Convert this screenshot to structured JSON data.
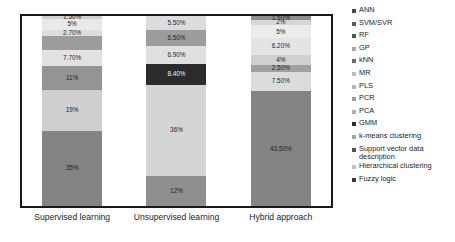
{
  "chart_data": {
    "type": "bar",
    "stacked": true,
    "orientation": "vertical",
    "title": "",
    "xlabel": "",
    "ylabel": "",
    "ylim": [
      0,
      100
    ],
    "grid": false,
    "legend_position": "right",
    "categories": [
      "Supervised learning",
      "Unsupervised learning",
      "Hybrid approach"
    ],
    "series": [
      {
        "name": "ANN",
        "color": "#808080",
        "values": [
          35,
          0,
          43.5
        ],
        "labels": [
          "35%",
          "",
          "43.50%"
        ]
      },
      {
        "name": "SVM/SVR",
        "color": "#c8c8c8",
        "values": [
          19,
          0,
          7.5
        ],
        "labels": [
          "19%",
          "",
          "7.50%"
        ]
      },
      {
        "name": "RF",
        "color": "#8a8a8a",
        "values": [
          11,
          0,
          2.5
        ],
        "labels": [
          "11%",
          "",
          "2.50%"
        ]
      },
      {
        "name": "GP",
        "color": "#dcdcdc",
        "values": [
          7.7,
          0,
          4
        ],
        "labels": [
          "7.70%",
          "",
          "4%"
        ]
      },
      {
        "name": "kNN",
        "color": "#9e9e9e",
        "values": [
          2.7,
          0,
          6.2
        ],
        "labels": [
          "2.70%",
          "",
          "6.20%"
        ]
      },
      {
        "name": "MR",
        "color": "#e6e6e6",
        "values": [
          5,
          0,
          5
        ],
        "labels": [
          "5%",
          "",
          "5%"
        ]
      },
      {
        "name": "PLS",
        "color": "#d2d2d2",
        "values": [
          1.5,
          0,
          2
        ],
        "labels": [
          "1.50%",
          "",
          "2%"
        ]
      },
      {
        "name": "PCR",
        "color": "#bdbdbd",
        "values": [
          0,
          0,
          1.5
        ],
        "labels": [
          "",
          "",
          "1.50%"
        ]
      },
      {
        "name": "PCA",
        "color": "#cfcfcf",
        "values": [
          0,
          0,
          0
        ],
        "labels": [
          "",
          "",
          ""
        ]
      },
      {
        "name": "GMM",
        "color": "#2b2b2b",
        "values": [
          0,
          8.4,
          0
        ],
        "labels": [
          "",
          "8.40%",
          ""
        ]
      },
      {
        "name": "k-means clustering",
        "color": "#d8d8d8",
        "values": [
          0,
          36,
          0
        ],
        "labels": [
          "",
          "36%",
          ""
        ]
      },
      {
        "name": "Support vector data description",
        "color": "#8f8f8f",
        "values": [
          0,
          12,
          0
        ],
        "labels": [
          "",
          "12%",
          ""
        ]
      },
      {
        "name": "Hierarchical clustering",
        "color": "#dadada",
        "values": [
          0,
          6.9,
          0
        ],
        "labels": [
          "",
          "6.90%",
          ""
        ]
      },
      {
        "name": "Fuzzy logic",
        "color": "#9a9a9a",
        "values": [
          0,
          6.5,
          0
        ],
        "labels": [
          "",
          "6.50%",
          ""
        ]
      }
    ],
    "bars": [
      {
        "category": "Supervised learning",
        "segments": [
          {
            "series": "PLS",
            "value": 1.5,
            "label": "1.50%",
            "color": "#d2d2d2",
            "dark": false
          },
          {
            "series": "MR",
            "value": 5,
            "label": "5%",
            "color": "#e9e9e9",
            "dark": false
          },
          {
            "series": "kNN",
            "value": 2.7,
            "label": "2.70%",
            "color": "#dddddd",
            "dark": false
          },
          {
            "series": "GP-dark",
            "value": 6.6,
            "label": "",
            "color": "#9c9c9c",
            "dark": false
          },
          {
            "series": "GP",
            "value": 7.7,
            "label": "7.70%",
            "color": "#e2e2e2",
            "dark": false
          },
          {
            "series": "RF",
            "value": 11,
            "label": "11%",
            "color": "#949494",
            "dark": false
          },
          {
            "series": "SVM/SVR",
            "value": 19,
            "label": "19%",
            "color": "#cfcfcf",
            "dark": false
          },
          {
            "series": "ANN",
            "value": 35,
            "label": "35%",
            "color": "#848484",
            "dark": false
          }
        ]
      },
      {
        "category": "Unsupervised learning",
        "segments": [
          {
            "series": "Hierarchical clustering",
            "value": 5.5,
            "label": "5.50%",
            "color": "#dcdcdc",
            "dark": false
          },
          {
            "series": "Fuzzy logic",
            "value": 6.5,
            "label": "6.50%",
            "color": "#9c9c9c",
            "dark": false
          },
          {
            "series": "Hierarchical",
            "value": 6.9,
            "label": "6.90%",
            "color": "#e0e0e0",
            "dark": false
          },
          {
            "series": "GMM",
            "value": 8.4,
            "label": "8.40%",
            "color": "#2b2b2b",
            "dark": true
          },
          {
            "series": "k-means clustering",
            "value": 36,
            "label": "36%",
            "color": "#d5d5d5",
            "dark": false
          },
          {
            "series": "Support vector data description",
            "value": 12,
            "label": "12%",
            "color": "#8f8f8f",
            "dark": false
          }
        ]
      },
      {
        "category": "Hybrid approach",
        "segments": [
          {
            "series": "PCR",
            "value": 1.5,
            "label": "1.50%",
            "color": "#8e8e8e",
            "dark": false
          },
          {
            "series": "PLS",
            "value": 2,
            "label": "2%",
            "color": "#d6d6d6",
            "dark": false
          },
          {
            "series": "MR",
            "value": 5,
            "label": "5%",
            "color": "#ececec",
            "dark": false
          },
          {
            "series": "kNN",
            "value": 6.2,
            "label": "6.20%",
            "color": "#e4e4e4",
            "dark": false
          },
          {
            "series": "GP",
            "value": 4,
            "label": "4%",
            "color": "#d0d0d0",
            "dark": false
          },
          {
            "series": "RF",
            "value": 2.5,
            "label": "2.50%",
            "color": "#a0a0a0",
            "dark": false
          },
          {
            "series": "SVM/SVR",
            "value": 7.5,
            "label": "7.50%",
            "color": "#dcdcdc",
            "dark": false
          },
          {
            "series": "ANN",
            "value": 43.5,
            "label": "43.50%",
            "color": "#848484",
            "dark": false
          }
        ]
      }
    ]
  },
  "legend": {
    "items": [
      {
        "label": "ANN",
        "color": "#4a4a4a"
      },
      {
        "label": "SVM/SVR",
        "color": "#5a5a5a"
      },
      {
        "label": "RF",
        "color": "#545454"
      },
      {
        "label": "GP",
        "color": "#a8a8a8"
      },
      {
        "label": "kNN",
        "color": "#6a6a6a"
      },
      {
        "label": "MR",
        "color": "#bdbdbd"
      },
      {
        "label": "PLS",
        "color": "#b5b5b5"
      },
      {
        "label": "PCR",
        "color": "#9c9c9c"
      },
      {
        "label": "PCA",
        "color": "#b0b0b0"
      },
      {
        "label": "GMM",
        "color": "#2b2b2b"
      },
      {
        "label": "k-means clustering",
        "color": "#a5a5a5"
      },
      {
        "label": "Support vector data description",
        "color": "#555555"
      },
      {
        "label": "Hierarchical clustering",
        "color": "#bfbfbf"
      },
      {
        "label": "Fuzzy logic",
        "color": "#3a3a3a"
      }
    ]
  }
}
